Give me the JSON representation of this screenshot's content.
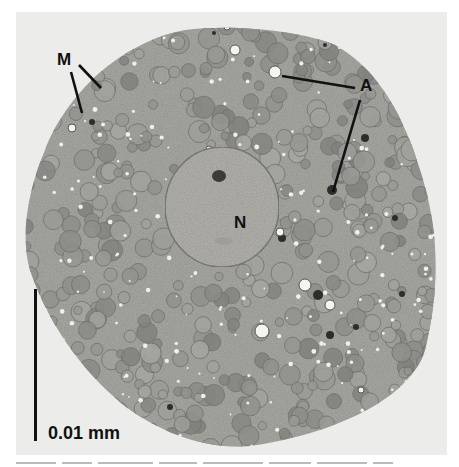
{
  "figure": {
    "type": "transmission electron micrograph",
    "colors": {
      "background": "#ffffff",
      "panel": "#ececea",
      "cytoplasm": "#a9a9a4",
      "nucleus": "#b2b1ab",
      "organelle": "#8f8e89",
      "label": "#111111"
    },
    "labels": {
      "mitochondria": "M",
      "autophagosome": "A",
      "nucleus": "N"
    },
    "scale_bar": {
      "label": "0.01 mm",
      "length_px": 152
    }
  }
}
